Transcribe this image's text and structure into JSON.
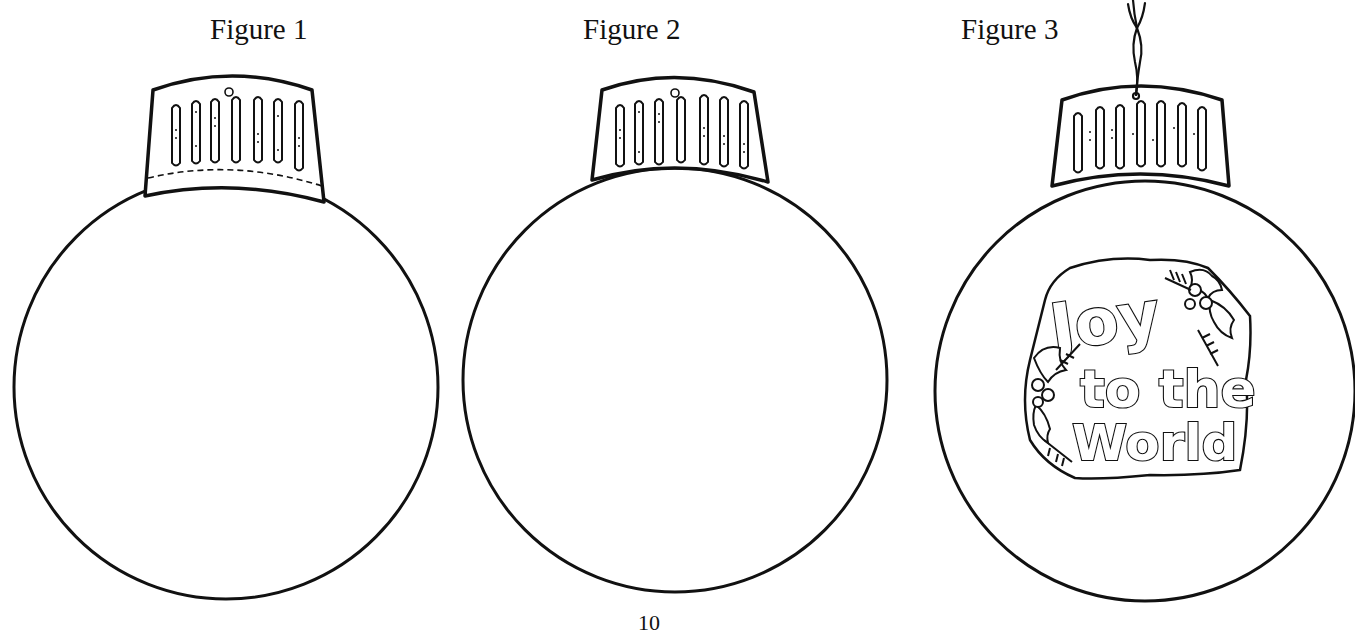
{
  "figures": [
    {
      "label": "Figure 1",
      "description": "Blank ornament outline with cap showing dashed fold line",
      "cap": {
        "dashed_fold_line": true,
        "hook_loop": true,
        "notches": 7
      }
    },
    {
      "label": "Figure 2",
      "description": "Blank ornament outline with cap attached",
      "cap": {
        "dashed_fold_line": false,
        "hook_loop": true,
        "notches": 7
      }
    },
    {
      "label": "Figure 3",
      "description": "Finished ornament with hanging string and decorated center",
      "cap": {
        "dashed_fold_line": false,
        "hook_loop": false,
        "notches": 7,
        "string": true
      },
      "decoration": {
        "text_lines": [
          "Joy",
          "to the",
          "World"
        ],
        "motif": "holly leaves and berries with pine sprigs"
      }
    }
  ],
  "page_number": "10",
  "colors": {
    "ink": "#111111",
    "paper": "#ffffff"
  }
}
